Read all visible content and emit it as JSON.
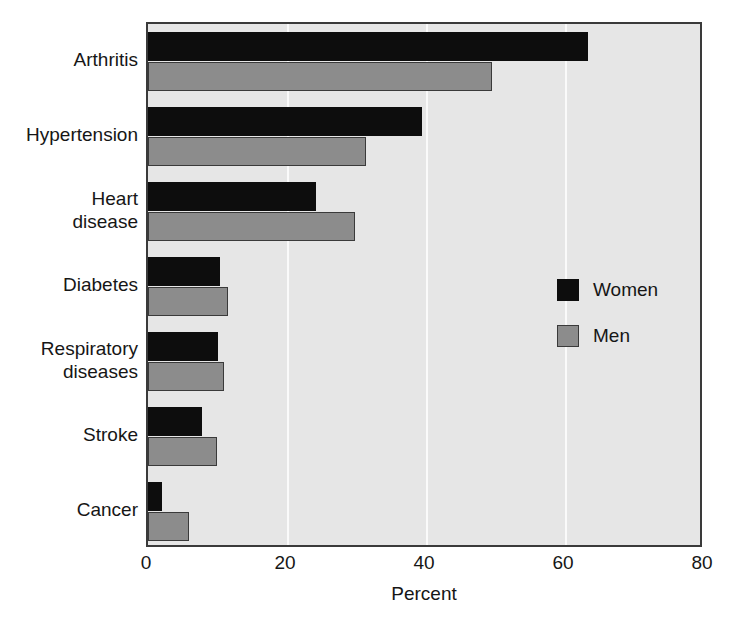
{
  "chart_data": {
    "type": "bar",
    "orientation": "horizontal",
    "title": "",
    "xlabel": "Percent",
    "ylabel": "",
    "xlim": [
      0,
      80
    ],
    "xticks": [
      0,
      20,
      40,
      60,
      80
    ],
    "xtick_labels": [
      "0",
      "20",
      "40",
      "60",
      "80"
    ],
    "grid": true,
    "grid_axis": "x",
    "legend_position": "center-right inside plot",
    "categories": [
      "Arthritis",
      "Hypertension",
      "Heart\ndisease",
      "Diabetes",
      "Respiratory\ndiseases",
      "Stroke",
      "Cancer"
    ],
    "series": [
      {
        "name": "Women",
        "color": "#0d0d0d",
        "values": [
          63.3,
          39.4,
          24.2,
          10.4,
          10.1,
          7.8,
          2.0
        ]
      },
      {
        "name": "Men",
        "color": "#8c8c8c",
        "values": [
          49.5,
          31.4,
          29.8,
          11.5,
          10.9,
          9.9,
          5.9
        ]
      }
    ]
  },
  "legend": {
    "items": [
      {
        "label": "Women",
        "swatch": "women"
      },
      {
        "label": "Men",
        "swatch": "men"
      }
    ]
  },
  "axis": {
    "x_title": "Percent"
  },
  "colors": {
    "women": "#0d0d0d",
    "men": "#8c8c8c",
    "plot_background": "#e6e6e6",
    "gridline": "#fafafa",
    "axis_line": "#3a3a3a",
    "text": "#161616"
  }
}
